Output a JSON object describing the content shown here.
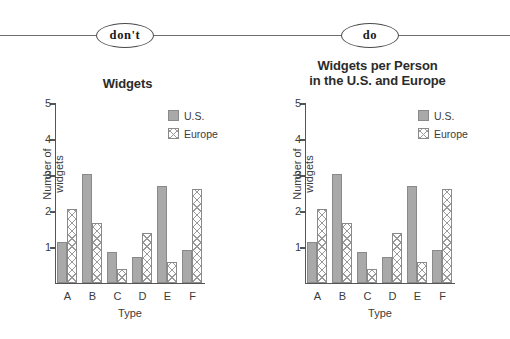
{
  "header": {
    "dont_label": "don't",
    "do_label": "do"
  },
  "charts": [
    {
      "id": "left",
      "title_lines": [
        "Widgets"
      ],
      "variant": "dont"
    },
    {
      "id": "right",
      "title_lines": [
        "Widgets per Person",
        "in the U.S. and Europe"
      ],
      "variant": "do"
    }
  ],
  "legend": {
    "items": [
      {
        "label": "U.S.",
        "style": "solid-gray",
        "color": "#a9a9a9"
      },
      {
        "label": "Europe",
        "style": "cross-hatch",
        "color": "#9a9a9a"
      }
    ]
  },
  "chart_data": [
    {
      "type": "bar",
      "title": "Widgets",
      "xlabel": "Type",
      "ylabel": "Number of widgets",
      "categories": [
        "A",
        "B",
        "C",
        "D",
        "E",
        "F"
      ],
      "series": [
        {
          "name": "U.S.",
          "values": [
            1.15,
            3.02,
            0.87,
            0.72,
            2.7,
            0.93
          ]
        },
        {
          "name": "Europe",
          "values": [
            2.06,
            1.68,
            0.4,
            1.4,
            0.57,
            2.61
          ]
        }
      ],
      "ylim": [
        0,
        5
      ],
      "yticks": [
        1,
        2,
        3,
        4,
        5
      ],
      "ytick_labels": [
        "1",
        "2",
        "3",
        "4",
        "5"
      ],
      "grid": false,
      "legend_position": "top-right"
    },
    {
      "type": "bar",
      "title": "Widgets per Person in the U.S. and Europe",
      "xlabel": "Type",
      "ylabel": "Number of widgets",
      "categories": [
        "A",
        "B",
        "C",
        "D",
        "E",
        "F"
      ],
      "series": [
        {
          "name": "U.S.",
          "values": [
            1.15,
            3.02,
            0.87,
            0.72,
            2.7,
            0.93
          ]
        },
        {
          "name": "Europe",
          "values": [
            2.06,
            1.68,
            0.4,
            1.4,
            0.57,
            2.61
          ]
        }
      ],
      "ylim": [
        0,
        5
      ],
      "yticks": [
        1,
        2,
        3,
        4,
        5
      ],
      "ytick_labels": [
        "1",
        "2",
        "3",
        "4",
        "5"
      ],
      "grid": false,
      "legend_position": "top-right"
    }
  ]
}
